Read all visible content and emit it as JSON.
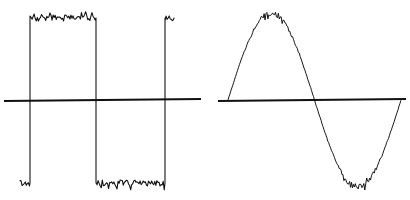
{
  "figure": {
    "background_color": "#ffffff",
    "trace_color": "#0b0b0b",
    "axis_color": "#101010",
    "width": 410,
    "height": 200
  },
  "chart_data": [
    {
      "type": "line",
      "name": "square-wave-trace",
      "title": "",
      "xlabel": "",
      "ylabel": "",
      "grid": false,
      "legend": "none",
      "xlim": [
        0,
        205
      ],
      "ylim": [
        200,
        0
      ],
      "zero_axis_y": 100,
      "axis_line": {
        "x_start": 4,
        "x_end": 201,
        "y_start": 101,
        "y_end": 99
      },
      "high_level_y": 18,
      "low_level_y": 183,
      "noise_amplitude": 5.5,
      "noise_step": 1.05,
      "noise_seed": 1771,
      "segments": [
        {
          "level": "low",
          "x_start": 20,
          "x_end": 30,
          "y": 183,
          "noisy": true
        },
        {
          "edge": "rising",
          "x": 30,
          "y_from": 183,
          "y_to": 18
        },
        {
          "level": "high",
          "x_start": 30,
          "x_end": 96,
          "y": 18,
          "noisy": true
        },
        {
          "edge": "falling",
          "x": 96,
          "y_from": 18,
          "y_to": 183
        },
        {
          "level": "low",
          "x_start": 96,
          "x_end": 165,
          "y": 183,
          "noisy": true
        },
        {
          "edge": "rising",
          "x": 165,
          "y_from": 183,
          "y_to": 18
        },
        {
          "level": "high",
          "x_start": 165,
          "x_end": 174,
          "y": 18,
          "noisy": true
        }
      ]
    },
    {
      "type": "line",
      "name": "sine-wave-trace",
      "title": "",
      "xlabel": "",
      "ylabel": "",
      "grid": false,
      "legend": "none",
      "xlim": [
        0,
        205
      ],
      "ylim": [
        200,
        0
      ],
      "zero_axis_y": 100,
      "axis_line": {
        "x_start": 13,
        "x_end": 201,
        "y_start": 101,
        "y_end": 99
      },
      "sine": {
        "x_start": 23,
        "x_end": 196,
        "period_x": 173,
        "phase_deg": 0,
        "amplitude": 87,
        "baseline_y": 100,
        "peak_x": 66,
        "peak_y": 13,
        "trough_x": 145,
        "trough_y": 188,
        "zero_crossings_x": [
          23,
          110,
          196
        ]
      },
      "noise_amplitude_peak": 5.0,
      "noise_amplitude_zero": 0.5,
      "noise_step": 0.95,
      "noise_seed": 40507
    }
  ]
}
